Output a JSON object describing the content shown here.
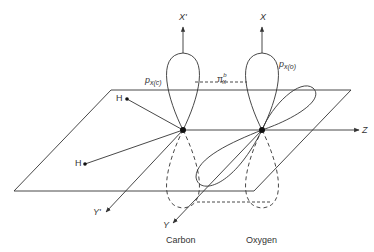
{
  "diagram": {
    "type": "molecular-orbital-schematic",
    "colors": {
      "line": "#333333",
      "background": "#ffffff"
    },
    "axes": {
      "x_prime": "X'",
      "x": "X",
      "z": "Z",
      "y_prime": "Y'",
      "y": "Y"
    },
    "orbitals": {
      "carbon_p": {
        "base": "p",
        "sub": "x(c)"
      },
      "oxygen_p": {
        "base": "p",
        "sub": "x(o)"
      },
      "pi_bond": {
        "base": "π",
        "sub": "x",
        "sup": "b"
      }
    },
    "atoms": {
      "h1": "H",
      "h2": "H"
    },
    "labels": {
      "carbon": "Carbon",
      "oxygen": "Oxygen"
    }
  }
}
